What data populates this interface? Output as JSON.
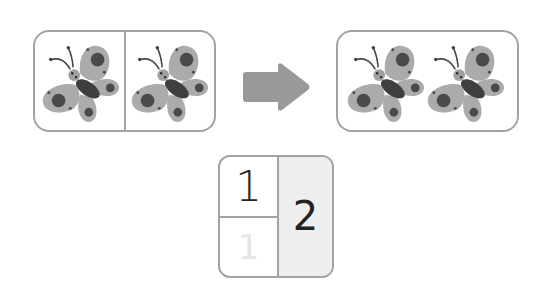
{
  "left_panel": {
    "label": "Two groups of one butterfly",
    "groups": [
      {
        "count": 1,
        "item": "butterfly"
      },
      {
        "count": 1,
        "item": "butterfly"
      }
    ]
  },
  "arrow": {
    "direction": "right",
    "color": "#999999"
  },
  "right_panel": {
    "label": "Combined group of two butterflies",
    "groups": [
      {
        "count": 2,
        "item": "butterfly"
      }
    ]
  },
  "tally_box": {
    "top_left": "1",
    "bottom_left": "1",
    "right": "2"
  },
  "colors": {
    "border": "#a3a3a3",
    "wing": "#ababab",
    "body": "#3f3f3f",
    "shaded_cell": "#eeeeee",
    "text": "#222222"
  }
}
